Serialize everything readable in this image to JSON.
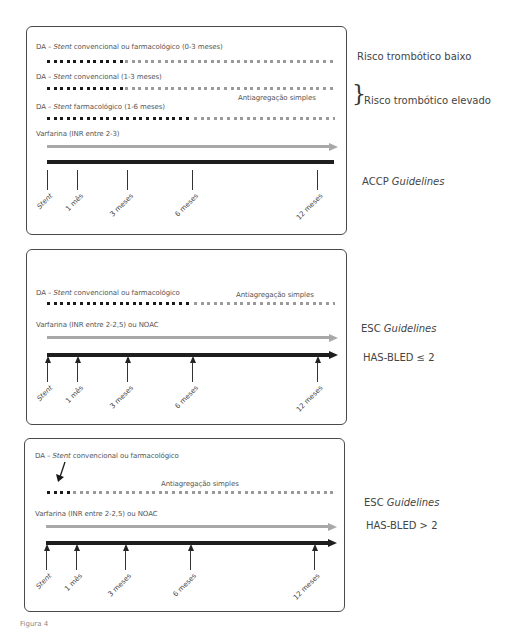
{
  "panels": [
    {
      "id": "accp",
      "rows": [
        {
          "label_pre": "DA – ",
          "label_italic": "Stent",
          "label_post": " convencional ou farmacológico (0-3 meses)"
        },
        {
          "label_pre": "DA – ",
          "label_italic": "Stent",
          "label_post": " convencional (1-3 meses)"
        },
        {
          "label_pre": "DA – ",
          "label_italic": "Stent",
          "label_post": " farmacológico (1-6 meses)"
        }
      ],
      "single_antiplatelet_label": "Antiagregação simples",
      "anticoag_label": "Varfarina (INR entre 2-3)",
      "ticks": [
        "Stent",
        "1 mês",
        "3 meses",
        "6 meses",
        "12 meses"
      ],
      "side_labels": {
        "risk_low": "Risco trombótico baixo",
        "risk_high": "Risco trombótico elevado",
        "guideline_prefix": "ACCP ",
        "guideline_italic": "Guidelines"
      }
    },
    {
      "id": "esc_low",
      "rows": [
        {
          "label_pre": "DA – ",
          "label_italic": "Stent",
          "label_post": " convencional ou farmacológico"
        }
      ],
      "single_antiplatelet_label": "Antiagregação simples",
      "anticoag_label": "Varfarina (INR entre 2-2,5) ou NOAC",
      "ticks": [
        "Stent",
        "1 mês",
        "3 meses",
        "6 meses",
        "12 meses"
      ],
      "side_labels": {
        "guideline_prefix": "ESC ",
        "guideline_italic": "Guidelines",
        "hasbled": "HAS-BLED ≤ 2"
      }
    },
    {
      "id": "esc_high",
      "rows": [
        {
          "label_pre": "DA – ",
          "label_italic": "Stent",
          "label_post": " convencional ou farmacológico"
        }
      ],
      "single_antiplatelet_label": "Antiagregação simples",
      "anticoag_label": "Varfarina (INR entre 2-2,5) ou NOAC",
      "ticks": [
        "Stent",
        "1 mês",
        "3 meses",
        "6 meses",
        "12 meses"
      ],
      "side_labels": {
        "guideline_prefix": "ESC ",
        "guideline_italic": "Guidelines",
        "hasbled": "HAS-BLED > 2"
      }
    }
  ],
  "colors": {
    "dual_antiplatelet": "#1a1a1a",
    "single_antiplatelet": "#9a9a9a",
    "anticoag_arrow": "#a8a8a8",
    "timeline": "#1e1e1e"
  },
  "caption": "Figura 4"
}
